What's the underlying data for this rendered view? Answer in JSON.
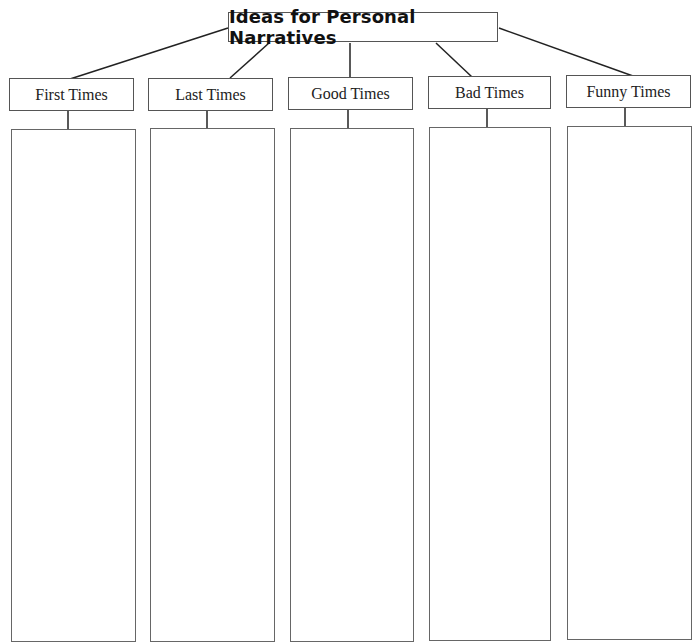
{
  "diagram": {
    "title": "Ideas for Personal Narratives",
    "categories": [
      {
        "label": "First Times",
        "entries": []
      },
      {
        "label": "Last Times",
        "entries": []
      },
      {
        "label": "Good Times",
        "entries": []
      },
      {
        "label": "Bad Times",
        "entries": []
      },
      {
        "label": "Funny Times",
        "entries": []
      }
    ]
  },
  "colors": {
    "line": "#222222",
    "border": "#555555",
    "background": "#ffffff"
  }
}
